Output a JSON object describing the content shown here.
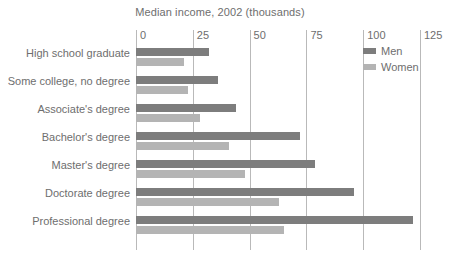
{
  "chart_data": {
    "type": "bar",
    "orientation": "horizontal",
    "title": "Median income, 2002 (thousands)",
    "xlabel": "",
    "ylabel": "",
    "xlim": [
      0,
      125
    ],
    "ticks": [
      "0",
      "25",
      "50",
      "75",
      "100",
      "125"
    ],
    "tick_values": [
      0,
      25,
      50,
      75,
      100,
      125
    ],
    "grid": true,
    "legend_position": "top-right",
    "categories": [
      "High school graduate",
      "Some college, no degree",
      "Associate's degree",
      "Bachelor's degree",
      "Master's degree",
      "Doctorate degree",
      "Professional degree"
    ],
    "series": [
      {
        "name": "Men",
        "color": "#7d7d7d",
        "values": [
          32,
          36,
          44,
          72,
          79,
          96,
          122
        ]
      },
      {
        "name": "Women",
        "color": "#b4b4b4",
        "values": [
          21,
          23,
          28,
          41,
          48,
          63,
          65
        ]
      }
    ]
  }
}
